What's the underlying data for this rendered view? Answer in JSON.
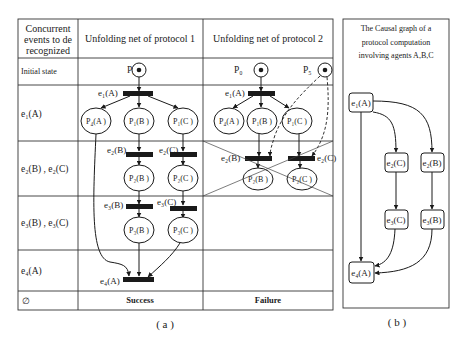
{
  "figure_a": {
    "caption": "( a )",
    "header": {
      "col0_line1": "Concurrent",
      "col0_line2": "events to de",
      "col0_line3": "recognized",
      "col1": "Unfolding net of protocol 1",
      "col2": "Unfolding net of protocol 2"
    },
    "rows": [
      {
        "label": "Initial state"
      },
      {
        "label": "e₁(A)"
      },
      {
        "label": "e₂(B) , e₂(C)"
      },
      {
        "label": "e₃(B) , e₃(C)"
      },
      {
        "label": "e₄(A)"
      },
      {
        "label": "∅"
      }
    ],
    "protocol1": {
      "places": {
        "p0": "P₀",
        "p4a": "P₄(A )",
        "p1b": "P₁(B )",
        "p1c": "P₁(C )",
        "p2b": "P₂(B )",
        "p2c": "P₂(C )",
        "p3b": "P₃(B )",
        "p3c": "P₃(C )"
      },
      "transitions": {
        "e1": "e₁(A)",
        "e2b": "e₂(B)",
        "e2c": "e₂(C)",
        "e3b": "e₃(B)",
        "e3c": "e₃(C)",
        "e4": "e₄(A)"
      },
      "result": "Success"
    },
    "protocol2": {
      "places": {
        "p0": "P₀",
        "p5": "P₅",
        "p4a": "P₄(A )",
        "p1b": "P₁(B )",
        "p1c": "P₁(C )",
        "p2b": "P₂(B )",
        "p2c": "P₂(C )"
      },
      "transitions": {
        "e1": "e₁(A)",
        "e2b": "e₂(B)",
        "e2c": "e₂(C)"
      },
      "result": "Failure"
    }
  },
  "figure_b": {
    "caption": "( b )",
    "title_line1": "The Causal graph of a",
    "title_line2": "protocol computation",
    "title_line3": "involving agents A,B,C",
    "nodes": {
      "e1a": "e₁(A)",
      "e2c": "e₂(C)",
      "e2b": "e₂(B)",
      "e3c": "e₃(C)",
      "e3b": "e₃(B)",
      "e4a": "e₄(A)"
    }
  }
}
